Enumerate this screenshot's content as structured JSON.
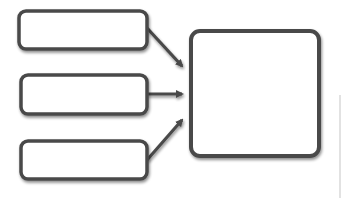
{
  "diagram": {
    "title": "",
    "colors": {
      "stroke": "#4a4a4a",
      "fill": "#ffffff",
      "shadow": "#9a9a9a",
      "edge_line": "#d8d8d8"
    },
    "input_boxes": [
      {
        "id": "input-1",
        "label": "",
        "x": 18,
        "y": 10,
        "w": 129,
        "h": 40
      },
      {
        "id": "input-2",
        "label": "",
        "x": 20,
        "y": 74,
        "w": 127,
        "h": 41
      },
      {
        "id": "input-3",
        "label": "",
        "x": 20,
        "y": 140,
        "w": 128,
        "h": 40
      }
    ],
    "output_box": {
      "id": "output",
      "label": "",
      "x": 190,
      "y": 30,
      "w": 130,
      "h": 127
    },
    "arrows": [
      {
        "from": "input-1",
        "to": "output",
        "x1": 147,
        "y1": 28,
        "x2": 184,
        "y2": 68
      },
      {
        "from": "input-2",
        "to": "output",
        "x1": 147,
        "y1": 94,
        "x2": 184,
        "y2": 94
      },
      {
        "from": "input-3",
        "to": "output",
        "x1": 147,
        "y1": 160,
        "x2": 184,
        "y2": 118
      }
    ]
  }
}
